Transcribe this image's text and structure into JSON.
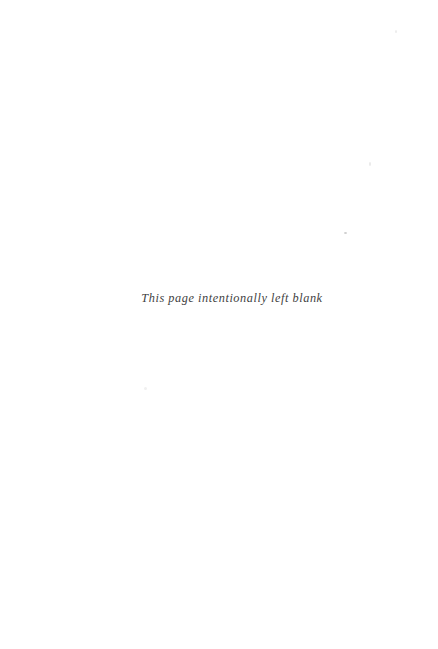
{
  "page": {
    "width": 438,
    "height": 649,
    "background_color": "#ffffff",
    "kind": "book-front-matter-blank-page"
  },
  "content": {
    "blank_notice": "This page intentionally left blank",
    "text_color": "#3f3f3f",
    "style": "italic-serif"
  },
  "artifacts": {
    "specks": [
      {
        "name": "speck-a",
        "color": "#ececec"
      },
      {
        "name": "speck-b",
        "color": "#e9e9e9"
      },
      {
        "name": "speck-c",
        "color": "#cfcfcf"
      },
      {
        "name": "speck-d",
        "color": "#f0f0f0"
      }
    ]
  }
}
